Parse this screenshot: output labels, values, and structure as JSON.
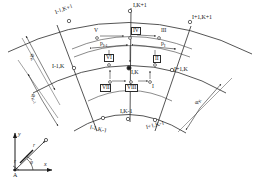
{
  "figure": {
    "type": "polar-grid-diagram"
  },
  "grid_nodes": [
    {
      "id": "n-im1-kp1",
      "label": "I-1,K+1",
      "x": 61,
      "y": 13,
      "marker": "open",
      "px": 69,
      "py": 21
    },
    {
      "id": "n-i-kp1",
      "label": "I,K+1",
      "x": 131,
      "y": 3,
      "marker": "open",
      "px": 130,
      "py": 11
    },
    {
      "id": "n-ip1-kp1",
      "label": "I+1,K+1",
      "x": 194,
      "y": 17,
      "marker": "open",
      "px": 190,
      "py": 22
    },
    {
      "id": "n-im1-k",
      "label": "I-1,K",
      "x": 57,
      "y": 64,
      "marker": "open",
      "px": 74,
      "py": 68
    },
    {
      "id": "n-i-k",
      "label": "I,K",
      "x": 133,
      "y": 66,
      "marker": "filled",
      "px": 129,
      "py": 68
    },
    {
      "id": "n-ip1-k",
      "label": "I+1,K",
      "x": 176,
      "y": 67,
      "marker": "open",
      "px": 172,
      "py": 70
    },
    {
      "id": "n-im1-km1",
      "label": "I-1,K-1",
      "x": 95,
      "y": 125,
      "marker": "open",
      "px": 103,
      "py": 118
    },
    {
      "id": "n-i-km1",
      "label": "I,K-1",
      "x": 126,
      "y": 112,
      "marker": "open",
      "px": 128,
      "py": 119
    },
    {
      "id": "n-ip1-km1",
      "label": "I+1,K-1",
      "x": 150,
      "y": 125,
      "marker": "open",
      "px": 155,
      "py": 120
    }
  ],
  "aux_points": [
    {
      "id": "aux-v",
      "label": "V",
      "x": 96,
      "y": 31,
      "boxed": false,
      "px": 97,
      "py": 38
    },
    {
      "id": "aux-iv",
      "label": "IV",
      "x": 133,
      "y": 30,
      "boxed": true,
      "px": 130,
      "py": 38
    },
    {
      "id": "aux-iii",
      "label": "III",
      "x": 159,
      "y": 31,
      "boxed": false,
      "px": 159,
      "py": 38
    },
    {
      "id": "aux-vi",
      "label": "VI",
      "x": 106,
      "y": 57,
      "boxed": true,
      "px": 109,
      "py": 65
    },
    {
      "id": "aux-ii",
      "label": "II",
      "x": 155,
      "y": 58,
      "boxed": true,
      "px": 155,
      "py": 65
    },
    {
      "id": "aux-vii",
      "label": "VII",
      "x": 103,
      "y": 86,
      "boxed": true,
      "px": 110,
      "py": 82
    },
    {
      "id": "aux-viii",
      "label": "VIII",
      "x": 128,
      "y": 86,
      "boxed": true,
      "px": 131,
      "py": 82
    },
    {
      "id": "aux-i",
      "label": "I",
      "x": 152,
      "y": 88,
      "boxed": false,
      "px": 150,
      "py": 82
    }
  ],
  "dimensions": [
    {
      "id": "dim-p-im1",
      "base": "p",
      "sub": "I-1",
      "x": 102,
      "y": 43,
      "rotate": 0
    },
    {
      "id": "dim-p-i",
      "base": "p",
      "sub": "I",
      "x": 163,
      "y": 43,
      "rotate": 0
    },
    {
      "id": "dim-phi-k",
      "base": "φ",
      "sub": "K",
      "x": 33,
      "y": 52,
      "rotate": 62
    },
    {
      "id": "dim-phi-km1",
      "base": "φ",
      "sub": "K-1",
      "x": 34,
      "y": 92,
      "rotate": 62
    },
    {
      "id": "dim-phi-right",
      "base": "φ",
      "sub": "K",
      "x": 198,
      "y": 100,
      "rotate": -58
    }
  ],
  "coordinate_system": {
    "origin_label": "A",
    "axis_x_label": "x",
    "axis_y_label": "y",
    "radius_label": "r",
    "angle_label": "φ",
    "origin": {
      "x": 15,
      "y": 168
    },
    "x_tip": {
      "x": 52,
      "y": 168
    },
    "y_tip": {
      "x": 15,
      "y": 133
    },
    "point": {
      "x": 45,
      "y": 140
    }
  },
  "colors": {
    "ink": "#1a1a1a",
    "line": "#2a2a2a",
    "thin": "#555555",
    "background": "#ffffff"
  }
}
